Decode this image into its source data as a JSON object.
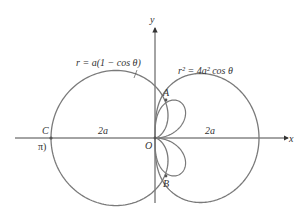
{
  "figure": {
    "axes": {
      "x_label": "x",
      "y_label": "y",
      "origin_label": "O"
    },
    "curves": [
      {
        "name": "cardioid",
        "equation": "r = a(1 − cos θ)"
      },
      {
        "name": "lemniscate-like",
        "equation": "r² = 4a² cos θ"
      }
    ],
    "points": {
      "A": "A",
      "B": "B",
      "C": "C",
      "C_note": "π)"
    },
    "dimension_labels": {
      "left": "2a",
      "right": "2a"
    },
    "colors": {
      "curve": "#7a7a7a",
      "axis": "#333333",
      "text": "#333333"
    }
  }
}
